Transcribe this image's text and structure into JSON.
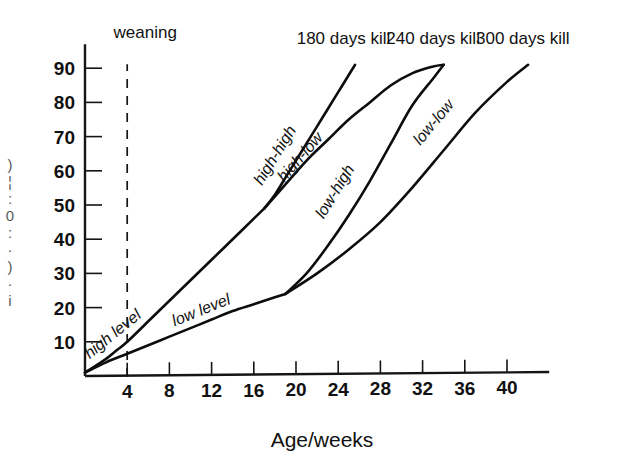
{
  "chart_data": {
    "type": "line",
    "title": "",
    "xlabel": "Age/weeks",
    "ylabel": "",
    "xlim": [
      0,
      44
    ],
    "ylim": [
      0,
      97
    ],
    "grid": false,
    "legend_position": "inline-curve-labels",
    "xticks": [
      4,
      8,
      12,
      16,
      20,
      24,
      28,
      32,
      36,
      40
    ],
    "yticks": [
      10,
      20,
      30,
      40,
      50,
      60,
      70,
      80,
      90
    ],
    "annotations": {
      "weaning": {
        "label": "weaning",
        "x": 4,
        "style": "dashed-vertical"
      },
      "kill_labels": [
        {
          "label": "180 days kill",
          "x": 24.5
        },
        {
          "label": "240 days kill",
          "x": 33.0
        },
        {
          "label": "300 days kill",
          "x": 41.5
        }
      ],
      "level_labels": [
        {
          "label": "high level",
          "x": 6.5,
          "y": 17
        },
        {
          "label": "low level",
          "x": 13.0,
          "y": 17
        }
      ]
    },
    "series": [
      {
        "name": "high level",
        "label": "high level",
        "points": [
          [
            0,
            1
          ],
          [
            1,
            3
          ],
          [
            2,
            5
          ],
          [
            3,
            7.5
          ],
          [
            4,
            10
          ],
          [
            6,
            16
          ],
          [
            8,
            22
          ],
          [
            10,
            28
          ],
          [
            12,
            34
          ],
          [
            14,
            40
          ],
          [
            16,
            46
          ],
          [
            17,
            49
          ]
        ]
      },
      {
        "name": "low level",
        "label": "low level",
        "points": [
          [
            0,
            1
          ],
          [
            2,
            4
          ],
          [
            4,
            6.5
          ],
          [
            6,
            9
          ],
          [
            8,
            11.5
          ],
          [
            10,
            14
          ],
          [
            12,
            16.5
          ],
          [
            14,
            19
          ],
          [
            16,
            21
          ],
          [
            18,
            23
          ],
          [
            19,
            24
          ]
        ]
      },
      {
        "name": "high-high",
        "label": "high-high",
        "points": [
          [
            17,
            49
          ],
          [
            18,
            53
          ],
          [
            19,
            58
          ],
          [
            20,
            63
          ],
          [
            21,
            68
          ],
          [
            22,
            73
          ],
          [
            23,
            78
          ],
          [
            24,
            83
          ],
          [
            25,
            88
          ],
          [
            25.6,
            91
          ]
        ]
      },
      {
        "name": "high-low",
        "label": "high-low",
        "points": [
          [
            17,
            49
          ],
          [
            19,
            56
          ],
          [
            21,
            63
          ],
          [
            23,
            69
          ],
          [
            25,
            75
          ],
          [
            27,
            80
          ],
          [
            29,
            85
          ],
          [
            31,
            88.5
          ],
          [
            33,
            90.5
          ],
          [
            34,
            91
          ]
        ]
      },
      {
        "name": "low-high",
        "label": "low-high",
        "points": [
          [
            19,
            24
          ],
          [
            21,
            30
          ],
          [
            23,
            38
          ],
          [
            25,
            47
          ],
          [
            27,
            57
          ],
          [
            29,
            68
          ],
          [
            31,
            79
          ],
          [
            33,
            87
          ],
          [
            34,
            91
          ]
        ]
      },
      {
        "name": "low-low",
        "label": "low-low",
        "points": [
          [
            19,
            24
          ],
          [
            22,
            30
          ],
          [
            25,
            37
          ],
          [
            28,
            45
          ],
          [
            31,
            55
          ],
          [
            34,
            66
          ],
          [
            37,
            77
          ],
          [
            40,
            86
          ],
          [
            42,
            91
          ]
        ]
      }
    ]
  },
  "edge_fragments": [
    ")",
    "¦",
    ":",
    "0",
    ":",
    "·",
    ")",
    "·",
    "i"
  ]
}
